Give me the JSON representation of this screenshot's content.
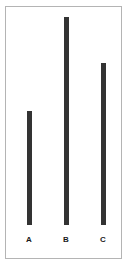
{
  "chart_data": {
    "type": "bar",
    "title": "",
    "subtitle": "",
    "xlabel": "",
    "ylabel": "",
    "categories": [
      "A",
      "B",
      "C"
    ],
    "values": [
      55,
      100,
      78
    ],
    "ylim": [
      0,
      100
    ],
    "grid": false,
    "legend": null,
    "orientation": "vertical",
    "bar_color": "#333333",
    "frame_color": "#b4b4b4",
    "background_color": "#ffffff",
    "annotations": []
  },
  "figure": {
    "bars": [
      {
        "label": "A",
        "value": 55,
        "height_pct": 55
      },
      {
        "label": "B",
        "value": 100,
        "height_pct": 100
      },
      {
        "label": "C",
        "value": 78,
        "height_pct": 78
      }
    ]
  }
}
